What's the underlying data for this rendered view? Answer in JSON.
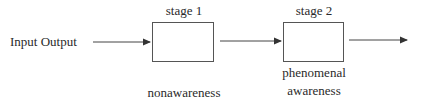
{
  "diagram": {
    "input_label": "Input Output",
    "stages": [
      {
        "title": "stage 1",
        "caption_lines": [
          "nonawareness"
        ]
      },
      {
        "title": "stage 2",
        "caption_lines": [
          "phenomenal",
          "awareness"
        ]
      }
    ],
    "colors": {
      "stroke": "#444444",
      "text": "#2a2a2a",
      "background": "#ffffff"
    }
  }
}
